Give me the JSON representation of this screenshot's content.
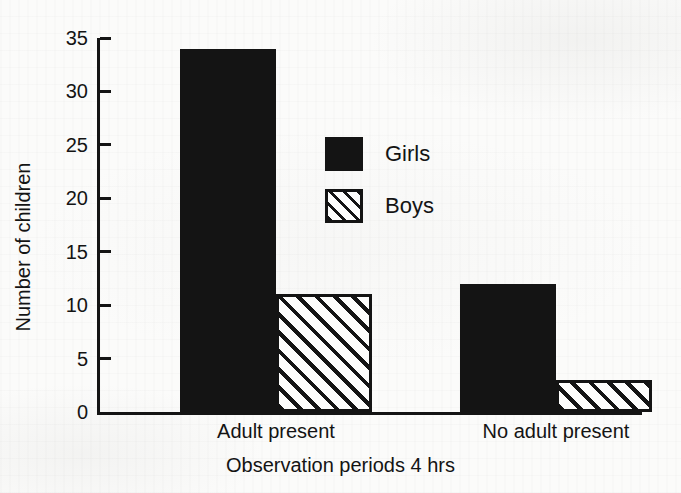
{
  "chart_data": {
    "type": "bar",
    "title": "",
    "subtitle": "",
    "xlabel": "Observation periods 4 hrs",
    "ylabel": "Number of children",
    "categories": [
      "Adult present",
      "No adult present"
    ],
    "series": [
      {
        "name": "Girls",
        "values": [
          34,
          12
        ],
        "fill": "solid",
        "color": "#141414"
      },
      {
        "name": "Boys",
        "values": [
          11,
          3
        ],
        "fill": "hatched",
        "color": "#141414"
      }
    ],
    "ylim": [
      0,
      35
    ],
    "ytick_values": [
      0,
      5,
      10,
      15,
      20,
      25,
      30,
      35
    ],
    "ytick_labels": [
      "0",
      "5",
      "10",
      "15",
      "20",
      "25",
      "30",
      "35"
    ],
    "grid": false,
    "legend_position": "inside-upper-center-right",
    "legend_entries": [
      "Girls",
      "Boys"
    ]
  }
}
